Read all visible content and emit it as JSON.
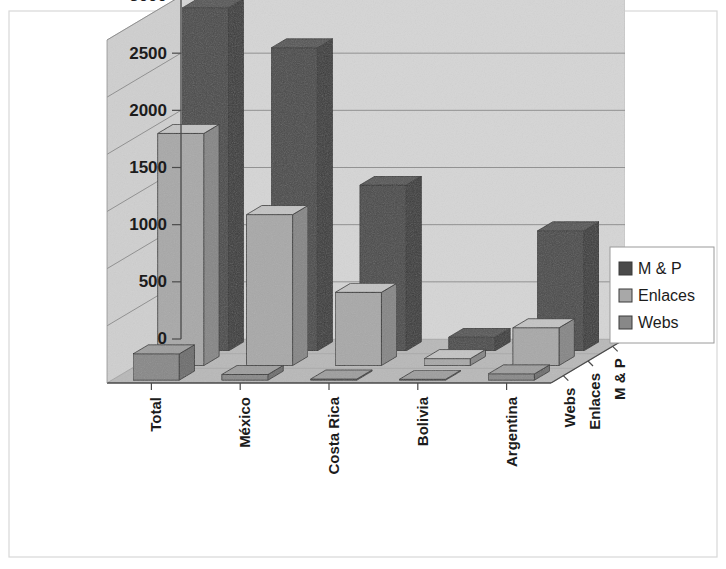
{
  "chart_data": {
    "type": "bar",
    "subtype": "3d-grouped-column",
    "title": "",
    "subtitle": "",
    "xlabel": "",
    "ylabel": "",
    "zlabel": "",
    "categories": [
      "Total",
      "México",
      "Costa Rica",
      "Bolivia",
      "Argentina"
    ],
    "depth_categories": [
      "Webs",
      "Enlaces",
      "M & P"
    ],
    "series": [
      {
        "name": "Webs",
        "values": [
          230,
          50,
          10,
          8,
          55
        ]
      },
      {
        "name": "Enlaces",
        "values": [
          2030,
          1320,
          640,
          60,
          330
        ]
      },
      {
        "name": "M & P",
        "values": [
          4250,
          2650,
          1450,
          120,
          1050
        ]
      }
    ],
    "ylim": [
      0,
      3000
    ],
    "yticks": [
      0,
      500,
      1000,
      1500,
      2000,
      2500,
      3000
    ],
    "ytick_labels": [
      "0",
      "500",
      "1000",
      "1500",
      "2000",
      "2500",
      "3000"
    ],
    "grid": true,
    "legend_position": "right",
    "legend_entries": [
      "M & P",
      "Enlaces",
      "Webs"
    ],
    "colors": {
      "m_p": "#4a4a4a",
      "enlaces": "#a8a8a8",
      "webs": "#888888",
      "wall": "#d5d5d5",
      "floor": "#b8b8b8",
      "grid": "#8a8a8a",
      "axis": "#4a4a4a",
      "text": "#1c1c1c",
      "background": "#ffffff"
    }
  },
  "axis": {
    "y_ticks": [
      {
        "label": "3000",
        "value": 3000
      },
      {
        "label": "2500",
        "value": 2500
      },
      {
        "label": "2000",
        "value": 2000
      },
      {
        "label": "1500",
        "value": 1500
      },
      {
        "label": "1000",
        "value": 1000
      },
      {
        "label": "500",
        "value": 500
      },
      {
        "label": "0",
        "value": 0
      }
    ],
    "category_labels": [
      "Total",
      "México",
      "Costa Rica",
      "Bolivia",
      "Argentina"
    ],
    "depth_labels": [
      "Webs",
      "Enlaces",
      "M & P"
    ]
  },
  "legend": {
    "items": [
      {
        "label": "M & P",
        "color": "#4a4a4a"
      },
      {
        "label": "Enlaces",
        "color": "#a8a8a8"
      },
      {
        "label": "Webs",
        "color": "#888888"
      }
    ]
  }
}
